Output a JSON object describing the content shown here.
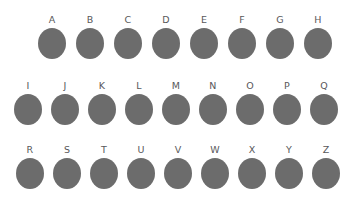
{
  "canvas": {
    "background_color": "#ffffff",
    "width": 364,
    "height": 208
  },
  "style": {
    "shape_fill_color": "#6c6c6c",
    "label_color": "#58585a",
    "shape_type": "ellipse"
  },
  "rows": [
    {
      "index": 0,
      "items": [
        {
          "label": "A"
        },
        {
          "label": "B"
        },
        {
          "label": "C"
        },
        {
          "label": "D"
        },
        {
          "label": "E"
        },
        {
          "label": "F"
        },
        {
          "label": "G"
        },
        {
          "label": "H"
        }
      ]
    },
    {
      "index": 1,
      "items": [
        {
          "label": "I"
        },
        {
          "label": "J"
        },
        {
          "label": "K"
        },
        {
          "label": "L"
        },
        {
          "label": "M"
        },
        {
          "label": "N"
        },
        {
          "label": "O"
        },
        {
          "label": "P"
        },
        {
          "label": "Q"
        }
      ]
    },
    {
      "index": 2,
      "items": [
        {
          "label": "R"
        },
        {
          "label": "S"
        },
        {
          "label": "T"
        },
        {
          "label": "U"
        },
        {
          "label": "V"
        },
        {
          "label": "W"
        },
        {
          "label": "X"
        },
        {
          "label": "Y"
        },
        {
          "label": "Z"
        }
      ]
    }
  ]
}
